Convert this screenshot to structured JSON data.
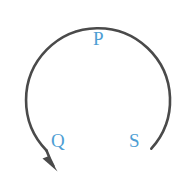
{
  "figure": {
    "background_color": "#ffffff",
    "width": 195,
    "height": 188
  },
  "arc": {
    "name": "open-circular-arc",
    "stroke_color": "#4a4a4a",
    "stroke_width": 2.6,
    "center_x": 97,
    "center_y": 92,
    "radius": 72,
    "start_angle_deg": 52,
    "sweep_deg": 281,
    "direction": "counterclockwise",
    "open_at": "bottom"
  },
  "arrow": {
    "name": "arc-direction-arrowhead",
    "color": "#4a4a4a",
    "tip_x": 57,
    "tip_y": 171,
    "points_toward": "down-right",
    "direction_label": "counterclockwise"
  },
  "labels": {
    "color": "#4e9ed4",
    "items": [
      {
        "id": "p",
        "text": "P",
        "x": 101,
        "y": 38,
        "position": "top"
      },
      {
        "id": "q",
        "text": "Q",
        "x": 58,
        "y": 140,
        "position": "bottom-left"
      },
      {
        "id": "s",
        "text": "S",
        "x": 136,
        "y": 140,
        "position": "bottom-right"
      }
    ]
  },
  "chart_data": {
    "type": "diagram",
    "title": "",
    "subtitle": "",
    "xlabel": "",
    "ylabel": "",
    "grid": false,
    "legend": false,
    "shapes": [
      {
        "kind": "arc",
        "center": [
          97,
          92
        ],
        "radius": 72,
        "start_angle_deg": 52,
        "end_angle_deg": 333,
        "sweep_deg": 281,
        "direction": "counterclockwise",
        "stroke": "#4a4a4a",
        "stroke_width": 2.6,
        "arrowhead_at": "end"
      }
    ],
    "annotations": [
      {
        "text": "P",
        "x": 101,
        "y": 38,
        "color": "#4e9ed4"
      },
      {
        "text": "Q",
        "x": 58,
        "y": 140,
        "color": "#4e9ed4"
      },
      {
        "text": "S",
        "x": 136,
        "y": 140,
        "color": "#4e9ed4"
      }
    ]
  }
}
